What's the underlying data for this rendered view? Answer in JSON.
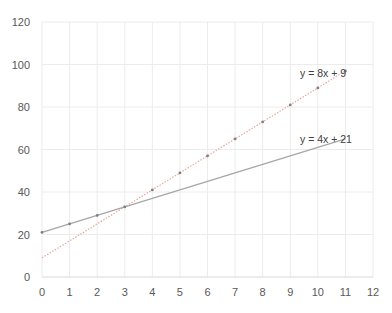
{
  "chart_data": {
    "type": "scatter",
    "title": "",
    "xlabel": "",
    "ylabel": "",
    "xlim": [
      0,
      12
    ],
    "ylim": [
      0,
      120
    ],
    "x_ticks": [
      0,
      1,
      2,
      3,
      4,
      5,
      6,
      7,
      8,
      9,
      10,
      11,
      12
    ],
    "y_ticks": [
      0,
      20,
      40,
      60,
      80,
      100,
      120
    ],
    "grid": true,
    "legend": "none",
    "series": [
      {
        "name": "data",
        "x": [
          0,
          1,
          2,
          3,
          4,
          5,
          6,
          7,
          8,
          9,
          10,
          11
        ],
        "y": [
          21,
          25,
          29,
          33,
          41,
          49,
          57,
          65,
          73,
          81,
          89,
          97
        ]
      }
    ],
    "trendlines": [
      {
        "label": "y = 8x + 9",
        "slope": 8,
        "intercept": 9,
        "x_range": [
          0,
          11
        ]
      },
      {
        "label": "y = 4x + 21",
        "slope": 4,
        "intercept": 21,
        "x_range": [
          0,
          11
        ]
      }
    ]
  },
  "colors": {
    "points": "#7f7f7f",
    "trend_steep": "#e8a7a0",
    "trend_shallow": "#a6a6a6",
    "grid": "#ececec",
    "axis": "#d9d9d9"
  }
}
